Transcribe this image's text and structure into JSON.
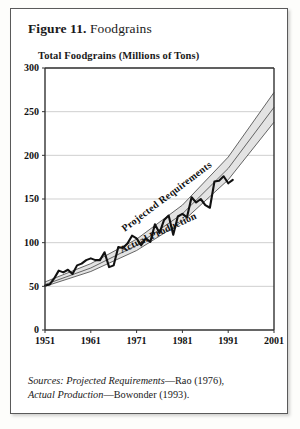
{
  "figure": {
    "number_label": "Figure 11.",
    "title": "Foodgrains",
    "axis_title": "Total Foodgrains (Millions of Tons)",
    "source_line_1_italic": "Sources: Projected Requirements",
    "source_line_1_rest": "—Rao (1976),",
    "source_line_2_italic": "Actual Production",
    "source_line_2_rest": "—Bowonder (1993)."
  },
  "colors": {
    "band_fill": "#e3e3e3",
    "band_stroke": "#555555",
    "actual_stroke": "#111111",
    "grid": "#bbbbbb",
    "axis": "#333333",
    "frame": "#5a5a5a"
  },
  "labels": {
    "projected": "Projected Requirements",
    "actual": "Actual Production"
  },
  "chart_data": {
    "type": "line",
    "title": "Figure 11. Foodgrains",
    "ylabel": "Total Foodgrains (Millions of Tons)",
    "xlabel": "",
    "xlim": [
      1951,
      2001
    ],
    "ylim": [
      0,
      300
    ],
    "yticks": [
      0,
      50,
      100,
      150,
      200,
      250,
      300
    ],
    "xticks": [
      1951,
      1961,
      1971,
      1981,
      1991,
      2001
    ],
    "grid": true,
    "legend": "inline-annotations",
    "series": [
      {
        "name": "Actual Production",
        "style": "jagged-thick-black",
        "x": [
          1951,
          1952,
          1953,
          1954,
          1955,
          1956,
          1957,
          1958,
          1959,
          1960,
          1961,
          1962,
          1963,
          1964,
          1965,
          1966,
          1967,
          1968,
          1969,
          1970,
          1971,
          1972,
          1973,
          1974,
          1975,
          1976,
          1977,
          1978,
          1979,
          1980,
          1981,
          1982,
          1983,
          1984,
          1985,
          1986,
          1987,
          1988,
          1989,
          1990,
          1991,
          1992
        ],
        "values": [
          51,
          52,
          59,
          68,
          66,
          69,
          64,
          74,
          76,
          80,
          82,
          80,
          80,
          89,
          72,
          74,
          95,
          94,
          99,
          108,
          105,
          97,
          105,
          101,
          121,
          111,
          126,
          131,
          109,
          130,
          133,
          129,
          152,
          146,
          150,
          143,
          140,
          170,
          171,
          176,
          168,
          172
        ]
      },
      {
        "name": "Projected Requirements (upper)",
        "style": "thin-grey-line",
        "x": [
          1951,
          1961,
          1971,
          1981,
          1991,
          2001
        ],
        "values": [
          55,
          76,
          104,
          143,
          198,
          272
        ]
      },
      {
        "name": "Projected Requirements (middle)",
        "style": "thin-grey-line",
        "x": [
          1951,
          1961,
          1971,
          1981,
          1991,
          2001
        ],
        "values": [
          52,
          71,
          97,
          133,
          185,
          255
        ]
      },
      {
        "name": "Projected Requirements (lower)",
        "style": "thin-grey-line",
        "x": [
          1951,
          1961,
          1971,
          1981,
          1991,
          2001
        ],
        "values": [
          50,
          67,
          91,
          124,
          172,
          238
        ]
      }
    ],
    "annotations": [
      {
        "text": "Projected Requirements",
        "x": 1978,
        "y": 150,
        "rotation": -37
      },
      {
        "text": "Actual Production",
        "x": 1976,
        "y": 108,
        "rotation": -25
      }
    ]
  }
}
